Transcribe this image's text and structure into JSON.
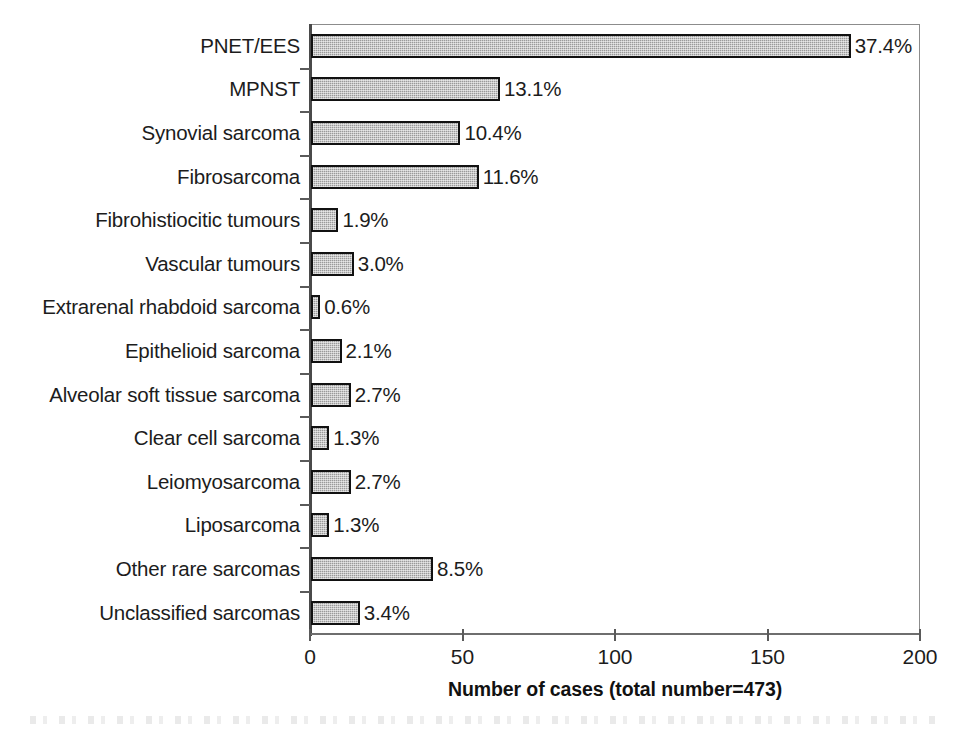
{
  "chart_data": {
    "type": "bar",
    "orientation": "horizontal",
    "title": "",
    "xlabel": "Number of cases (total number=473)",
    "ylabel": "",
    "xlim": [
      0,
      200
    ],
    "xticks": [
      0,
      50,
      100,
      150,
      200
    ],
    "xticklabels": [
      "0",
      "50",
      "100",
      "150",
      "200"
    ],
    "grid": false,
    "legend": null,
    "total_cases": 473,
    "categories": [
      "PNET/EES",
      "MPNST",
      "Synovial sarcoma",
      "Fibrosarcoma",
      "Fibrohistiocitic tumours",
      "Vascular tumours",
      "Extrarenal rhabdoid sarcoma",
      "Epithelioid sarcoma",
      "Alveolar soft tissue sarcoma",
      "Clear cell sarcoma",
      "Leiomyosarcoma",
      "Liposarcoma",
      "Other rare sarcomas",
      "Unclassified sarcomas"
    ],
    "values": [
      177,
      62,
      49,
      55,
      9,
      14,
      3,
      10,
      13,
      6,
      13,
      6,
      40,
      16
    ],
    "data_labels": [
      "37.4%",
      "13.1%",
      "10.4%",
      "11.6%",
      "1.9%",
      "3.0%",
      "0.6%",
      "2.1%",
      "2.7%",
      "1.3%",
      "2.7%",
      "1.3%",
      "8.5%",
      "3.4%"
    ],
    "percentages": [
      37.4,
      13.1,
      10.4,
      11.6,
      1.9,
      3.0,
      0.6,
      2.1,
      2.7,
      1.3,
      2.7,
      1.3,
      8.5,
      3.4
    ],
    "colors": {
      "bar_fill": "#9a9a9a",
      "bar_edge": "#111111",
      "axis": "#4a4a4a",
      "text": "#1c1c1c",
      "background": "#ffffff"
    }
  }
}
